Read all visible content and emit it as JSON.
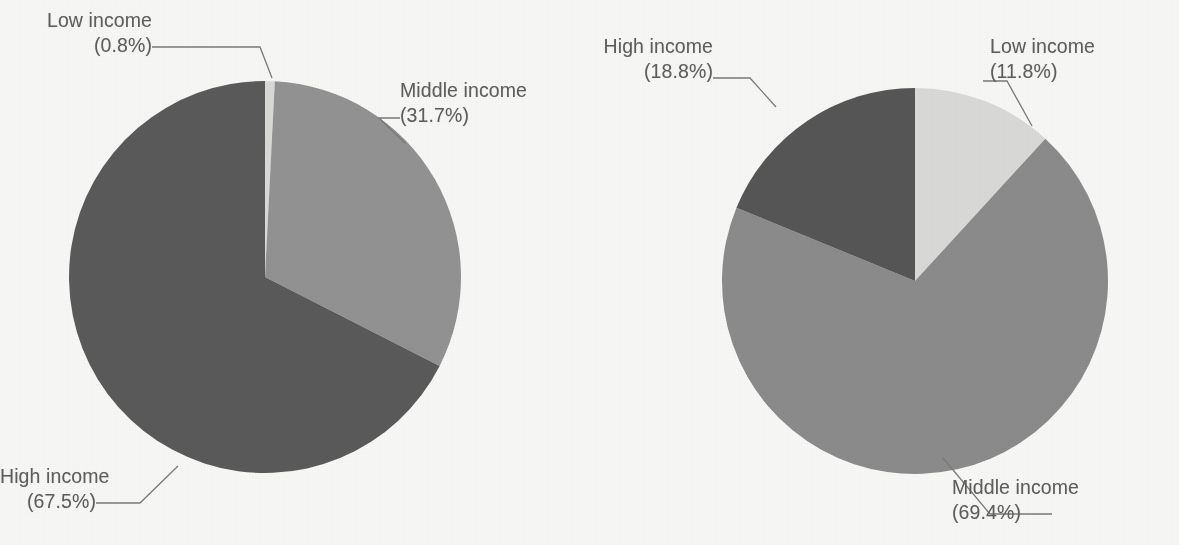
{
  "figure": {
    "background_color": "#f7f7f5",
    "label_text_color": "#5e5e5e",
    "leader_line_color": "#7a7a7a"
  },
  "palette": {
    "low_income": "#d9d9d7",
    "middle_income_left": "#929292",
    "middle_income_right": "#8b8b8b",
    "high_income_left": "#5a5a5a",
    "high_income_right": "#565656"
  },
  "charts": [
    {
      "id": "left",
      "labels": {
        "low": {
          "line1": "Low income",
          "line2": "(0.8%)"
        },
        "middle": {
          "line1": "Middle income",
          "line2": "(31.7%)"
        },
        "high": {
          "line1": "High income",
          "line2": "(67.5%)"
        }
      }
    },
    {
      "id": "right",
      "labels": {
        "high": {
          "line1": "High income",
          "line2": "(18.8%)"
        },
        "low": {
          "line1": "Low income",
          "line2": "(11.8%)"
        },
        "middle": {
          "line1": "Middle income",
          "line2": "(69.4%)"
        }
      }
    }
  ],
  "chart_data": [
    {
      "type": "pie",
      "id": "left-pie",
      "title": "",
      "categories": [
        "Low income",
        "Middle income",
        "High income"
      ],
      "values": [
        0.8,
        31.7,
        67.5
      ],
      "unit": "%",
      "start_angle_deg": 0,
      "direction": "clockwise",
      "colors": [
        "#d9d9d7",
        "#929292",
        "#5a5a5a"
      ],
      "labels": [
        "Low income (0.8%)",
        "Middle income (31.7%)",
        "High income (67.5%)"
      ],
      "legend": "none",
      "label_style": "external-with-leader-lines"
    },
    {
      "type": "pie",
      "id": "right-pie",
      "title": "",
      "categories": [
        "Low income",
        "Middle income",
        "High income"
      ],
      "values": [
        11.8,
        69.4,
        18.8
      ],
      "unit": "%",
      "start_angle_deg": 0,
      "direction": "clockwise",
      "colors": [
        "#d9d9d7",
        "#8b8b8b",
        "#565656"
      ],
      "labels": [
        "Low income (11.8%)",
        "Middle income (69.4%)",
        "High income (18.8%)"
      ],
      "legend": "none",
      "label_style": "external-with-leader-lines"
    }
  ]
}
